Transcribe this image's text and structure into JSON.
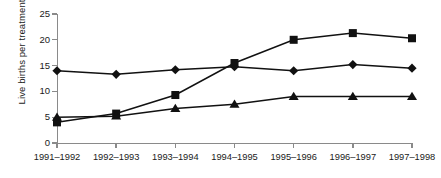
{
  "chart_data": {
    "type": "line",
    "title": "",
    "xlabel": "",
    "ylabel": "Live births per treatment cycle",
    "categories": [
      "1991–1992",
      "1992–1993",
      "1993–1994",
      "1994–1995",
      "1995–1996",
      "1996–1997",
      "1997–1998"
    ],
    "ylim": [
      0,
      25
    ],
    "yticks": [
      0,
      5,
      10,
      15,
      20,
      25
    ],
    "ytick_labels": [
      "0",
      "5",
      "10",
      "15",
      "20",
      "25"
    ],
    "grid": false,
    "legend": "none",
    "series": [
      {
        "name": "diamond-series",
        "marker": "diamond",
        "color": "#111111",
        "values": [
          14.0,
          13.3,
          14.2,
          14.8,
          14.0,
          15.2,
          14.5
        ]
      },
      {
        "name": "square-series",
        "marker": "square",
        "color": "#111111",
        "values": [
          4.0,
          5.7,
          9.3,
          15.5,
          20.0,
          21.3,
          20.3
        ]
      },
      {
        "name": "triangle-series",
        "marker": "triangle",
        "color": "#111111",
        "values": [
          5.0,
          5.2,
          6.7,
          7.5,
          9.0,
          9.0,
          9.0
        ]
      }
    ]
  }
}
